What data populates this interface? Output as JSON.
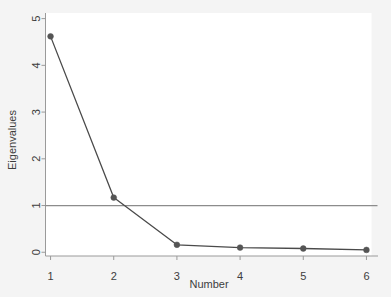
{
  "chart_data": {
    "type": "line",
    "title": "",
    "subtitle": "",
    "xlabel": "Number",
    "ylabel": "Eigenvalues",
    "x": [
      1,
      2,
      3,
      4,
      5,
      6
    ],
    "values": [
      4.62,
      1.17,
      0.16,
      0.1,
      0.08,
      0.05
    ],
    "series": [
      {
        "name": "Eigenvalues",
        "x": [
          1,
          2,
          3,
          4,
          5,
          6
        ],
        "values": [
          4.62,
          1.17,
          0.16,
          0.1,
          0.08,
          0.05
        ],
        "marker": "circle",
        "color": "#4a4a4a"
      }
    ],
    "xlim": [
      0.92,
      6.08
    ],
    "ylim": [
      -0.08,
      5.12
    ],
    "xticks": [
      1,
      2,
      3,
      4,
      5,
      6
    ],
    "xtick_labels": [
      "1",
      "2",
      "3",
      "4",
      "5",
      "6"
    ],
    "yticks": [
      0,
      1,
      2,
      3,
      4,
      5
    ],
    "ytick_labels": [
      "0",
      "1",
      "2",
      "3",
      "4",
      "5"
    ],
    "grid": false,
    "legend": "none",
    "reference_lines": [
      {
        "name": "kaiser-criterion-line",
        "orientation": "horizontal",
        "value": 1,
        "color": "#808080"
      }
    ],
    "colors": {
      "line": "#4a4a4a",
      "marker": "#555555",
      "axis": "#9a9a9a",
      "reference_line": "#8c8c8c",
      "plot_background": "#ffffff",
      "page_background": "#f4f4f4",
      "text": "#3d3d3d"
    }
  },
  "axes": {
    "y_axis_title": "Eigenvalues",
    "x_axis_title": "Number"
  }
}
